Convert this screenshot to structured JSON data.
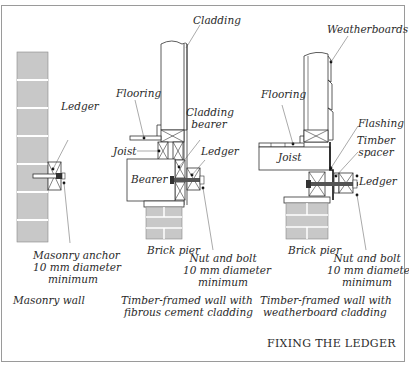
{
  "title": "FIXING THE LEDGER",
  "panels": [
    {
      "caption": "Masonry wall",
      "labels": {
        "ledger": "Ledger",
        "anchor_line1": "Masonry anchor",
        "anchor_line2": "10 mm diameter",
        "anchor_line3": "minimum"
      }
    },
    {
      "caption_line1": "Timber-framed wall with",
      "caption_line2": "fibrous cement cladding",
      "labels": {
        "cladding": "Cladding",
        "flooring": "Flooring",
        "cladding_bearer_line1": "Cladding",
        "cladding_bearer_line2": "bearer",
        "joist": "Joist",
        "ledger": "Ledger",
        "bearer": "Bearer",
        "brick_pier": "Brick pier",
        "bolt_line1": "Nut and bolt",
        "bolt_line2": "10 mm diameter",
        "bolt_line3": "minimum"
      }
    },
    {
      "caption_line1": "Timber-framed wall with",
      "caption_line2": "weatherboard cladding",
      "labels": {
        "weatherboards": "Weatherboards",
        "flooring": "Flooring",
        "flashing": "Flashing",
        "timber_spacer_line1": "Timber",
        "timber_spacer_line2": "spacer",
        "joist": "Joist",
        "ledger": "Ledger",
        "brick_pier": "Brick pier",
        "bolt_line1": "Nut and bolt",
        "bolt_line2": "10 mm diameter",
        "bolt_line3": "minimum"
      }
    }
  ],
  "colors": {
    "brick": "#c8c8c8",
    "line": "#333333",
    "border": "#9a9a9a"
  }
}
